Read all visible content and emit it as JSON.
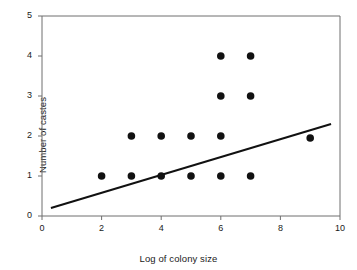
{
  "chart_data": {
    "type": "scatter",
    "title": "",
    "xlabel": "Log of colony size",
    "ylabel": "Number of castes",
    "xlim": [
      0,
      10
    ],
    "ylim": [
      0,
      5
    ],
    "xticks": [
      0,
      2,
      4,
      6,
      8,
      10
    ],
    "yticks": [
      0,
      1,
      2,
      3,
      4,
      5
    ],
    "xtick_labels": [
      "0",
      "2",
      "4",
      "6",
      "8",
      "10"
    ],
    "ytick_labels": [
      "0",
      "1",
      "2",
      "3",
      "4",
      "5"
    ],
    "grid": false,
    "legend": null,
    "marker": "filled-circle",
    "marker_color": "#111111",
    "points": [
      {
        "x": 2,
        "y": 1
      },
      {
        "x": 3,
        "y": 1
      },
      {
        "x": 3,
        "y": 2
      },
      {
        "x": 4,
        "y": 1
      },
      {
        "x": 4,
        "y": 2
      },
      {
        "x": 5,
        "y": 1
      },
      {
        "x": 5,
        "y": 2
      },
      {
        "x": 6,
        "y": 1
      },
      {
        "x": 6,
        "y": 2
      },
      {
        "x": 6,
        "y": 3
      },
      {
        "x": 6,
        "y": 4
      },
      {
        "x": 7,
        "y": 1
      },
      {
        "x": 7,
        "y": 3
      },
      {
        "x": 7,
        "y": 4
      },
      {
        "x": 9,
        "y": 1.95
      }
    ],
    "trendline": {
      "type": "linear-fit",
      "color": "#111111",
      "x_start": 0.3,
      "y_start": 0.2,
      "x_end": 9.7,
      "y_end": 2.3
    }
  },
  "axis": {
    "y_label": "Number of castes",
    "x_label": "Log of colony size"
  }
}
